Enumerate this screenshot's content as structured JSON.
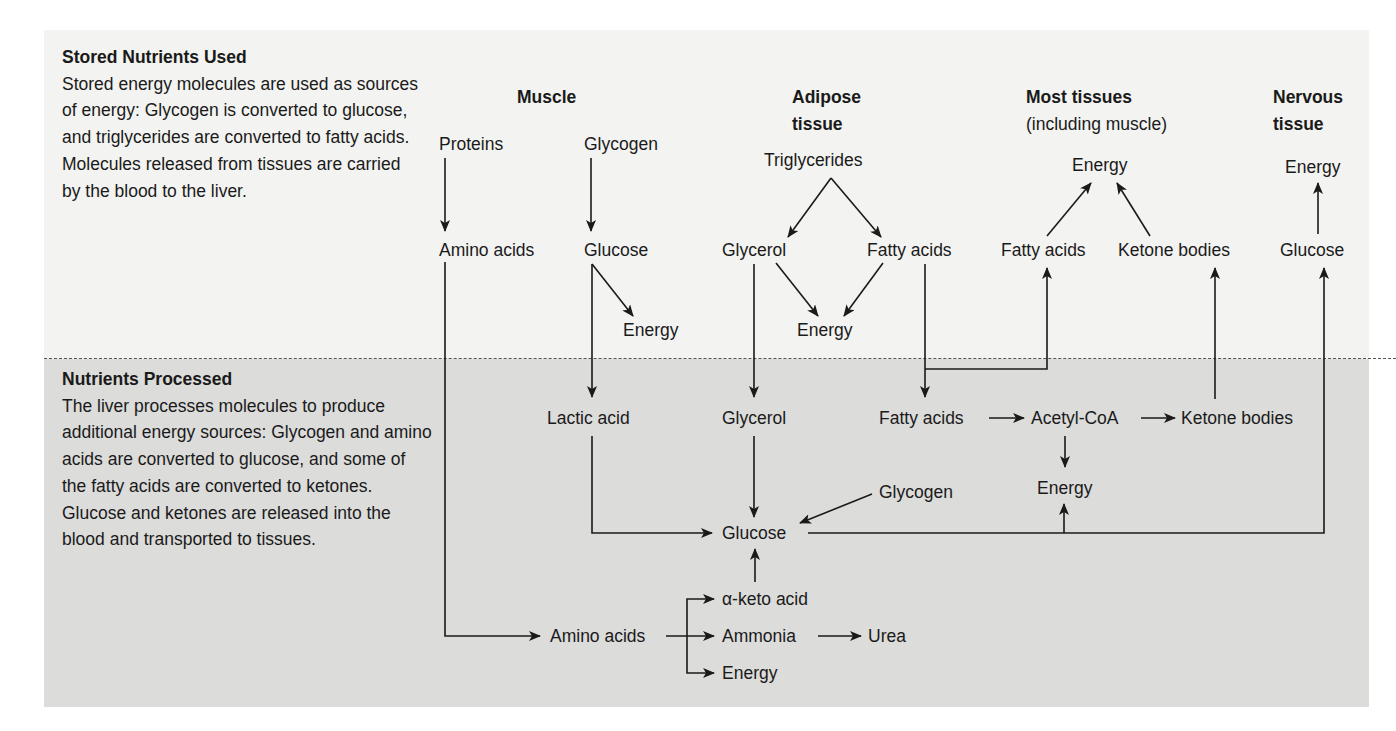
{
  "figure": {
    "colors": {
      "top_panel_bg": "#f3f3f1",
      "bottom_panel_bg": "#dcdcda",
      "line": "#1a1a1a",
      "divider": "#555555"
    }
  },
  "captions": {
    "stored": {
      "title": "Stored Nutrients Used",
      "body": "Stored energy molecules are used as sources of energy: Glycogen is converted to glucose, and triglycerides are converted to fatty acids. Molecules released from tissues are carried by the blood to the liver."
    },
    "processed": {
      "title": "Nutrients Processed",
      "body": "The liver processes molecules to produce additional energy sources: Glycogen and amino acids are converted to glucose, and some of the fatty acids are converted to ketones. Glucose and ketones are released into the blood and transported to tissues."
    }
  },
  "columns": {
    "muscle": {
      "title": "Muscle"
    },
    "adipose": {
      "title": "Adipose",
      "title2": "tissue"
    },
    "most": {
      "title": "Most tissues",
      "subtitle": "(including muscle)"
    },
    "nervous": {
      "title": "Nervous",
      "title2": "tissue"
    }
  },
  "nodes": {
    "muscle_proteins": "Proteins",
    "muscle_glycogen": "Glycogen",
    "muscle_amino": "Amino acids",
    "muscle_glucose": "Glucose",
    "muscle_energy": "Energy",
    "adipose_trig": "Triglycerides",
    "adipose_glycerol": "Glycerol",
    "adipose_fatty": "Fatty acids",
    "adipose_energy": "Energy",
    "most_energy": "Energy",
    "most_fatty": "Fatty acids",
    "most_ketone": "Ketone bodies",
    "nervous_energy": "Energy",
    "nervous_glucose": "Glucose",
    "liver_lactic": "Lactic acid",
    "liver_glycerol": "Glycerol",
    "liver_fatty": "Fatty acids",
    "liver_acetyl": "Acetyl-CoA",
    "liver_ketone": "Ketone bodies",
    "liver_acetyl_energy": "Energy",
    "liver_glycogen": "Glycogen",
    "liver_glucose": "Glucose",
    "liver_keto": "α-keto acid",
    "liver_amino": "Amino acids",
    "liver_ammonia": "Ammonia",
    "liver_urea": "Urea",
    "liver_amino_energy": "Energy"
  },
  "edges": [
    [
      "Proteins",
      "Amino acids (muscle)"
    ],
    [
      "Glycogen (muscle)",
      "Glucose (muscle)"
    ],
    [
      "Glucose (muscle)",
      "Energy (muscle)"
    ],
    [
      "Glucose (muscle)",
      "Lactic acid"
    ],
    [
      "Amino acids (muscle)",
      "Amino acids (liver)"
    ],
    [
      "Triglycerides",
      "Glycerol (adipose)"
    ],
    [
      "Triglycerides",
      "Fatty acids (adipose)"
    ],
    [
      "Glycerol (adipose)",
      "Energy (adipose)"
    ],
    [
      "Fatty acids (adipose)",
      "Energy (adipose)"
    ],
    [
      "Glycerol (adipose)",
      "Glycerol (liver)"
    ],
    [
      "Fatty acids (adipose)",
      "Fatty acids (liver)"
    ],
    [
      "Fatty acids (adipose)",
      "Fatty acids (most tissues)"
    ],
    [
      "Fatty acids (most tissues)",
      "Energy (most tissues)"
    ],
    [
      "Ketone bodies (most tissues)",
      "Energy (most tissues)"
    ],
    [
      "Glucose (nervous)",
      "Energy (nervous)"
    ],
    [
      "Lactic acid",
      "Glucose (liver)"
    ],
    [
      "Glycerol (liver)",
      "Glucose (liver)"
    ],
    [
      "Glycogen (liver)",
      "Glucose (liver)"
    ],
    [
      "α-keto acid",
      "Glucose (liver)"
    ],
    [
      "Fatty acids (liver)",
      "Acetyl-CoA"
    ],
    [
      "Acetyl-CoA",
      "Ketone bodies (liver)"
    ],
    [
      "Acetyl-CoA",
      "Energy (liver)"
    ],
    [
      "Ketone bodies (liver)",
      "Ketone bodies (most tissues)"
    ],
    [
      "Glucose (liver)",
      "Glucose (nervous)"
    ],
    [
      "Glucose (liver)",
      "Energy (liver)"
    ],
    [
      "Amino acids (liver)",
      "α-keto acid"
    ],
    [
      "Amino acids (liver)",
      "Ammonia"
    ],
    [
      "Amino acids (liver)",
      "Energy (amino)"
    ],
    [
      "Ammonia",
      "Urea"
    ]
  ]
}
